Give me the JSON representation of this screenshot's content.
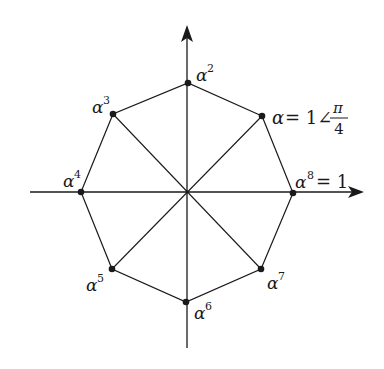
{
  "diagram": {
    "type": "phasor-diagram",
    "colors": {
      "line": "#1a1a1a",
      "background": "#ffffff"
    },
    "center": [
      187,
      192
    ],
    "axes": {
      "horizontal": {
        "from": [
          30,
          192
        ],
        "to": [
          363,
          192
        ]
      },
      "vertical": {
        "from": [
          187,
          348
        ],
        "to": [
          187,
          26
        ]
      }
    },
    "vertices": [
      {
        "id": "alpha1",
        "xy": [
          262,
          116
        ],
        "base": "α",
        "sup": "",
        "suffix": "= 1∠",
        "frac_num": "π",
        "frac_den": "4"
      },
      {
        "id": "alpha2",
        "xy": [
          188,
          83
        ],
        "base": "α",
        "sup": "2"
      },
      {
        "id": "alpha3",
        "xy": [
          113,
          114
        ],
        "base": "α",
        "sup": "3"
      },
      {
        "id": "alpha4",
        "xy": [
          81,
          192
        ],
        "base": "α",
        "sup": "4"
      },
      {
        "id": "alpha5",
        "xy": [
          112,
          269
        ],
        "base": "α",
        "sup": "5"
      },
      {
        "id": "alpha6",
        "xy": [
          186,
          302
        ],
        "base": "α",
        "sup": "6"
      },
      {
        "id": "alpha7",
        "xy": [
          261,
          269
        ],
        "base": "α",
        "sup": "7"
      },
      {
        "id": "alpha8",
        "xy": [
          293,
          193
        ],
        "base": "α",
        "sup": "8",
        "suffix": "= 1"
      }
    ]
  }
}
